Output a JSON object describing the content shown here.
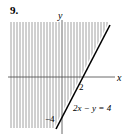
{
  "problem_number": "9.",
  "axes": {
    "x_label": "x",
    "y_label": "y"
  },
  "ticks": {
    "x_intercept": "2",
    "y_intercept": "−4"
  },
  "equation": "2x − y = 4",
  "shading": "left of line (2x − y ≤ 4 side)",
  "colors": {
    "line": "#000000",
    "shade": "#888888"
  }
}
